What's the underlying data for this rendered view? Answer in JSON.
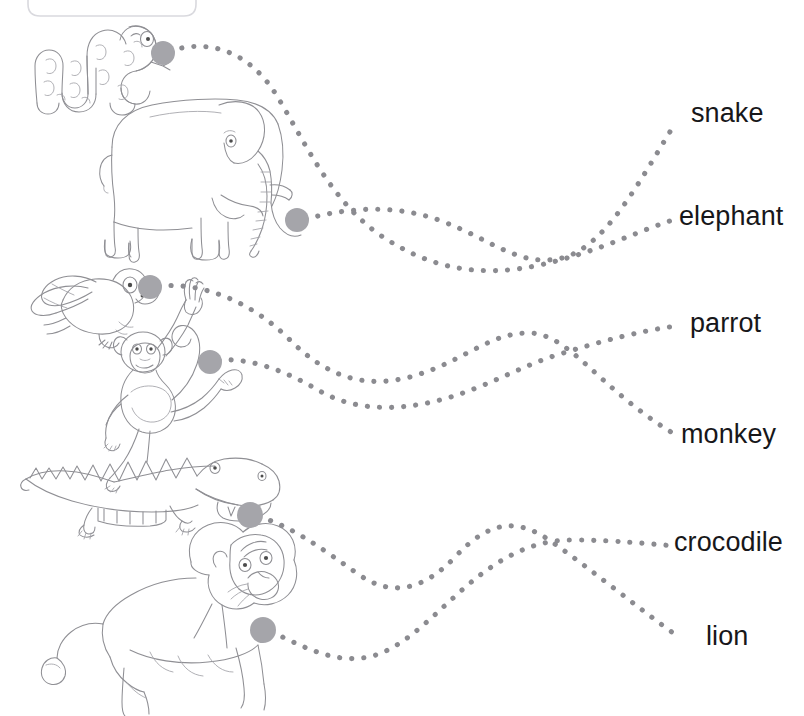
{
  "worksheet": {
    "type": "match-the-animal-to-the-word",
    "title_box": {
      "text": ""
    },
    "ink_color": "#8f8f94",
    "dot_color": "#8b8b90",
    "anchor_color": "#a5a5aa",
    "text_color": "#17171a",
    "background": "#ffffff"
  },
  "animals": [
    {
      "id": "snake",
      "name": "snake",
      "icon": "snake-illustration",
      "anchor": {
        "x": 163,
        "y": 53
      },
      "connects_to": "elephant"
    },
    {
      "id": "elephant",
      "name": "elephant",
      "icon": "elephant-illustration",
      "anchor": {
        "x": 297,
        "y": 220
      },
      "connects_to": "snake"
    },
    {
      "id": "parrot",
      "name": "parrot",
      "icon": "parrot-illustration",
      "anchor": {
        "x": 150,
        "y": 287
      },
      "connects_to": "monkey"
    },
    {
      "id": "monkey",
      "name": "monkey",
      "icon": "monkey-illustration",
      "anchor": {
        "x": 210,
        "y": 362
      },
      "connects_to": "parrot"
    },
    {
      "id": "crocodile",
      "name": "crocodile",
      "icon": "crocodile-illustration",
      "anchor": {
        "x": 250,
        "y": 515
      },
      "connects_to": "lion"
    },
    {
      "id": "lion",
      "name": "lion",
      "icon": "lion-illustration",
      "anchor": {
        "x": 263,
        "y": 630
      },
      "connects_to": "crocodile"
    }
  ],
  "labels": [
    {
      "id": "snake",
      "text": "snake",
      "x": 691,
      "y": 100
    },
    {
      "id": "elephant",
      "text": "elephant",
      "x": 679,
      "y": 203
    },
    {
      "id": "parrot",
      "text": "parrot",
      "x": 690,
      "y": 310
    },
    {
      "id": "monkey",
      "text": "monkey",
      "x": 681,
      "y": 421
    },
    {
      "id": "crocodile",
      "text": "crocodile",
      "x": 674,
      "y": 529
    },
    {
      "id": "lion",
      "text": "lion",
      "x": 706,
      "y": 623
    }
  ]
}
